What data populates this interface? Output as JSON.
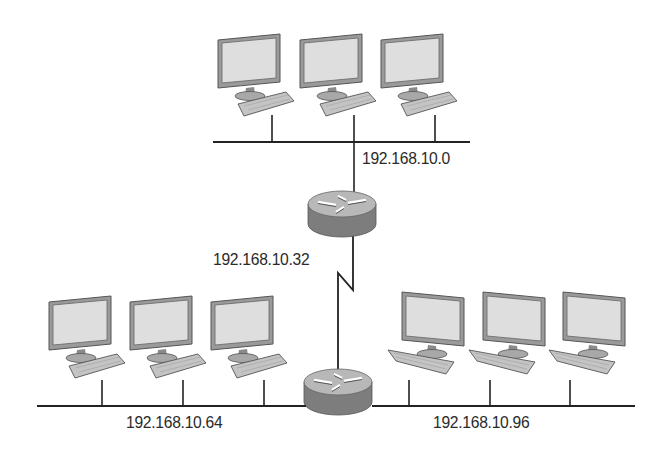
{
  "diagram": {
    "type": "network-topology",
    "colors": {
      "line": "#222222",
      "monitor_frame": "#8a8a8a",
      "monitor_screen": "#dcdcdc",
      "keyboard": "#bdbdbd",
      "router_top": "#b5b5b5",
      "router_side": "#7d7d7d"
    },
    "networks": [
      {
        "id": "top-lan",
        "label": "192.168.10.0",
        "hosts": 3
      },
      {
        "id": "serial-link",
        "label": "192.168.10.32"
      },
      {
        "id": "bottom-left-lan",
        "label": "192.168.10.64",
        "hosts": 3
      },
      {
        "id": "bottom-right-lan",
        "label": "192.168.10.96",
        "hosts": 3
      }
    ],
    "routers": [
      {
        "id": "router-1",
        "icon": "router-icon"
      },
      {
        "id": "router-2",
        "icon": "router-icon"
      }
    ]
  }
}
